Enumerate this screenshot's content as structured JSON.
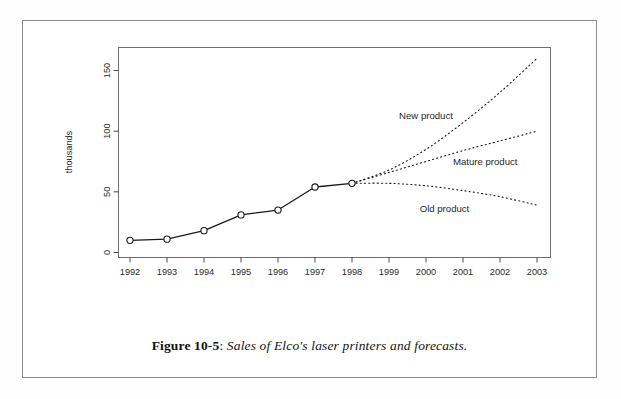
{
  "figure": {
    "caption_label": "Figure 10-5",
    "caption_separator": ":",
    "caption_text": "Sales of Elco's laser printers and forecasts."
  },
  "chart_data": {
    "type": "line",
    "title": "",
    "subtitle": "",
    "xlabel": "",
    "ylabel": "thousands",
    "xlim": [
      1991.6,
      2003.4
    ],
    "ylim": [
      0,
      165
    ],
    "grid": false,
    "legend_position": "inline-annotations",
    "x_tick_labels": [
      "1992",
      "1993",
      "1994",
      "1995",
      "1996",
      "1997",
      "1998",
      "1999",
      "2000",
      "2001",
      "2002",
      "2003"
    ],
    "y_tick_labels": [
      "0",
      "50",
      "100",
      "150"
    ],
    "y_ticks": [
      0,
      50,
      100,
      150
    ],
    "x": [
      1992,
      1993,
      1994,
      1995,
      1996,
      1997,
      1998,
      1999,
      2000,
      2001,
      2002,
      2003
    ],
    "series": [
      {
        "name": "Actual sales",
        "style": "solid",
        "marker": "open-circle",
        "color": "#1a1a1a",
        "x": [
          1992,
          1993,
          1994,
          1995,
          1996,
          1997,
          1998
        ],
        "values": [
          10,
          11,
          18,
          31,
          35,
          54,
          57
        ]
      },
      {
        "name": "New product",
        "style": "dotted",
        "marker": "none",
        "color": "#1a1a1a",
        "x": [
          1998,
          1999,
          2000,
          2001,
          2002,
          2003
        ],
        "values": [
          57,
          68,
          85,
          107,
          132,
          160
        ]
      },
      {
        "name": "Mature product",
        "style": "dotted",
        "marker": "none",
        "color": "#1a1a1a",
        "x": [
          1998,
          1999,
          2000,
          2001,
          2002,
          2003
        ],
        "values": [
          57,
          66,
          75,
          84,
          92,
          100
        ]
      },
      {
        "name": "Old product",
        "style": "dotted",
        "marker": "none",
        "color": "#1a1a1a",
        "x": [
          1998,
          1999,
          2000,
          2001,
          2002,
          2003
        ],
        "values": [
          57,
          57,
          55,
          51,
          46,
          39
        ]
      }
    ],
    "annotations": [
      {
        "text": "New product",
        "x": 2000.0,
        "y": 110
      },
      {
        "text": "Mature product",
        "x": 2001.6,
        "y": 72
      },
      {
        "text": "Old product",
        "x": 2000.5,
        "y": 33
      }
    ],
    "colors": {
      "line": "#1a1a1a",
      "axis": "#4a4a4a",
      "text": "#2b2b2b",
      "page_border": "#8c8c8c",
      "background": "#ffffff"
    }
  }
}
